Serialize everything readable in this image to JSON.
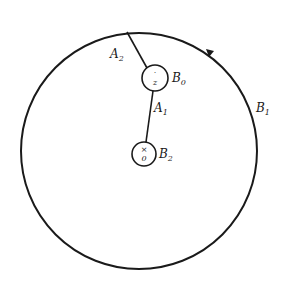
{
  "diagram": {
    "colors": {
      "stroke": "#1a1a1a",
      "background": "#ffffff"
    },
    "outer_circle": {
      "label": "B",
      "label_sub": "1",
      "center": [
        139,
        151
      ],
      "radius": 118
    },
    "circles": [
      {
        "id": "B0",
        "label": "B",
        "label_sub": "0",
        "center_mark": "z",
        "center": [
          155,
          78
        ],
        "radius": 13
      },
      {
        "id": "B2",
        "label": "B",
        "label_sub": "2",
        "center_mark": "0",
        "center": [
          144,
          154
        ],
        "radius": 12
      }
    ],
    "segments": [
      {
        "id": "A1",
        "label": "A",
        "label_sub": "1",
        "from": [
          153,
          91
        ],
        "to": [
          146,
          142
        ]
      },
      {
        "id": "A2",
        "label": "A",
        "label_sub": "2",
        "from": [
          127,
          32
        ],
        "to": [
          147,
          68
        ]
      }
    ],
    "arrow": {
      "position": [
        211,
        53
      ],
      "direction": "counterclockwise"
    }
  }
}
